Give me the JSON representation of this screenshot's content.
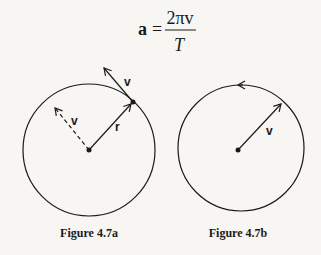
{
  "equation": {
    "lhs": "a",
    "equals": "=",
    "numerator": "2πv",
    "denominator": "T"
  },
  "figure_a": {
    "caption": "Figure 4.7a",
    "velocity_label": "v",
    "dashed_velocity_label": "v",
    "radius_label": "r"
  },
  "figure_b": {
    "caption": "Figure 4.7b",
    "velocity_label": "v"
  },
  "colors": {
    "ink": "#1a1a1a",
    "background": "#f7f6f3"
  }
}
